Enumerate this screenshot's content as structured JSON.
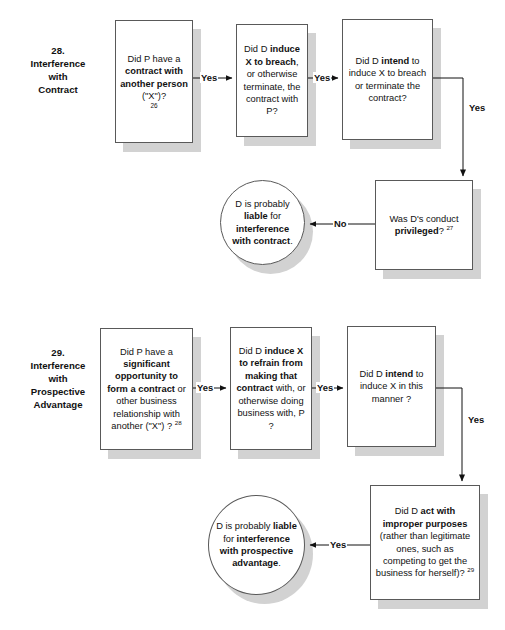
{
  "document": {
    "title": "Interference with Contract and Prospective Advantage flowcharts",
    "background_color": "#ffffff",
    "node_border_color": "#595959",
    "node_shadow_color": "#d2d2d2",
    "text_color": "#111111"
  },
  "sections": [
    {
      "id": "section-28",
      "caption": "28.\nInterference\nwith\nContract",
      "caption_lines": [
        "28.",
        "Interference",
        "with",
        "Contract"
      ],
      "nodes": [
        {
          "id": "n28-1",
          "shape": "box",
          "text_plain": "Did P have a contract with another person (\"X\")? 26",
          "footnote": "26",
          "runs": [
            {
              "t": "Did P have a ",
              "b": false
            },
            {
              "t": "contract with another person",
              "b": true
            },
            {
              "t": " (\"X\")?",
              "b": false
            }
          ]
        },
        {
          "id": "n28-2",
          "shape": "box",
          "text_plain": "Did D induce X to breach, or otherwise terminate, the contract with P?",
          "runs": [
            {
              "t": "Did D ",
              "b": false
            },
            {
              "t": "induce X to breach",
              "b": true
            },
            {
              "t": ", or otherwise terminate, the contract with P?",
              "b": false
            }
          ]
        },
        {
          "id": "n28-3",
          "shape": "box",
          "text_plain": "Did D intend to induce X to breach or terminate the contract?",
          "runs": [
            {
              "t": "Did D ",
              "b": false
            },
            {
              "t": "intend",
              "b": true
            },
            {
              "t": " to induce X to breach or terminate the contract?",
              "b": false
            }
          ]
        },
        {
          "id": "n28-4",
          "shape": "box",
          "text_plain": "Was D's conduct privileged? 27",
          "footnote": "27",
          "runs": [
            {
              "t": "Was D's conduct ",
              "b": false
            },
            {
              "t": "privileged",
              "b": true
            },
            {
              "t": "?",
              "b": false
            }
          ]
        },
        {
          "id": "n28-5",
          "shape": "ellipse",
          "text_plain": "D is probably liable for interference with contract.",
          "runs": [
            {
              "t": "D is probably ",
              "b": false
            },
            {
              "t": "liable",
              "b": true
            },
            {
              "t": " for ",
              "b": false
            },
            {
              "t": "interference with contract",
              "b": true
            },
            {
              "t": ".",
              "b": false
            }
          ]
        }
      ],
      "connectors": [
        {
          "id": "c28-1",
          "from": "n28-1",
          "to": "n28-2",
          "label": "Yes"
        },
        {
          "id": "c28-2",
          "from": "n28-2",
          "to": "n28-3",
          "label": "Yes"
        },
        {
          "id": "c28-3",
          "from": "n28-3",
          "to": "n28-4",
          "label": "Yes"
        },
        {
          "id": "c28-4",
          "from": "n28-4",
          "to": "n28-5",
          "label": "No"
        }
      ]
    },
    {
      "id": "section-29",
      "caption": "29.\nInterference\nwith\nProspective\nAdvantage",
      "caption_lines": [
        "29.",
        "Interference",
        "with",
        "Prospective",
        "Advantage"
      ],
      "nodes": [
        {
          "id": "n29-1",
          "shape": "box",
          "text_plain": "Did P have a significant opportunity to form a contract or other business relationship with another (\"X\") ? 28",
          "footnote": "28",
          "runs": [
            {
              "t": "Did P have a ",
              "b": false
            },
            {
              "t": "significant opportunity to form a contract",
              "b": true
            },
            {
              "t": " or other business relationship with another (\"X\") ?",
              "b": false
            }
          ]
        },
        {
          "id": "n29-2",
          "shape": "box",
          "text_plain": "Did D induce X to refrain from making that contract with, or otherwise doing business with, P ?",
          "runs": [
            {
              "t": "Did D ",
              "b": false
            },
            {
              "t": "induce X to refrain from making that contract",
              "b": true
            },
            {
              "t": " with, or otherwise doing business with, P ?",
              "b": false
            }
          ]
        },
        {
          "id": "n29-3",
          "shape": "box",
          "text_plain": "Did D intend to induce X in this manner ?",
          "runs": [
            {
              "t": "Did D ",
              "b": false
            },
            {
              "t": "intend",
              "b": true
            },
            {
              "t": " to induce X in this manner ?",
              "b": false
            }
          ]
        },
        {
          "id": "n29-4",
          "shape": "box",
          "text_plain": "Did D act with improper purposes (rather than legitimate ones, such as competing to get the business for herself)? 29",
          "footnote": "29",
          "runs": [
            {
              "t": "Did D ",
              "b": false
            },
            {
              "t": "act with improper purposes",
              "b": true
            },
            {
              "t": " (rather than legitimate ones, such as competing to get the business for herself)?",
              "b": false
            }
          ]
        },
        {
          "id": "n29-5",
          "shape": "ellipse",
          "text_plain": "D is probably liable for interference with prospective advantage.",
          "runs": [
            {
              "t": "D is probably ",
              "b": false
            },
            {
              "t": "liable",
              "b": true
            },
            {
              "t": " for ",
              "b": false
            },
            {
              "t": "interference with prospective advantage",
              "b": true
            },
            {
              "t": ".",
              "b": false
            }
          ]
        }
      ],
      "connectors": [
        {
          "id": "c29-1",
          "from": "n29-1",
          "to": "n29-2",
          "label": "Yes"
        },
        {
          "id": "c29-2",
          "from": "n29-2",
          "to": "n29-3",
          "label": "Yes"
        },
        {
          "id": "c29-3",
          "from": "n29-3",
          "to": "n29-4",
          "label": "Yes"
        },
        {
          "id": "c29-4",
          "from": "n29-4",
          "to": "n29-5",
          "label": "Yes"
        }
      ]
    }
  ],
  "labels": {
    "yes": "Yes",
    "no": "No",
    "s28_yes_1": "Yes",
    "s28_yes_2": "Yes",
    "s28_yes_3": "Yes",
    "s28_no_1": "No",
    "s29_yes_1": "Yes",
    "s29_yes_2": "Yes",
    "s29_yes_3": "Yes",
    "s29_yes_4": "Yes"
  },
  "caption28": {
    "l1": "28.",
    "l2": "Interference",
    "l3": "with",
    "l4": "Contract"
  },
  "caption29": {
    "l1": "29.",
    "l2": "Interference",
    "l3": "with",
    "l4": "Prospective",
    "l5": "Advantage"
  },
  "footnotes": {
    "f26": "26",
    "f27": "27",
    "f28": "28",
    "f29": "29"
  }
}
